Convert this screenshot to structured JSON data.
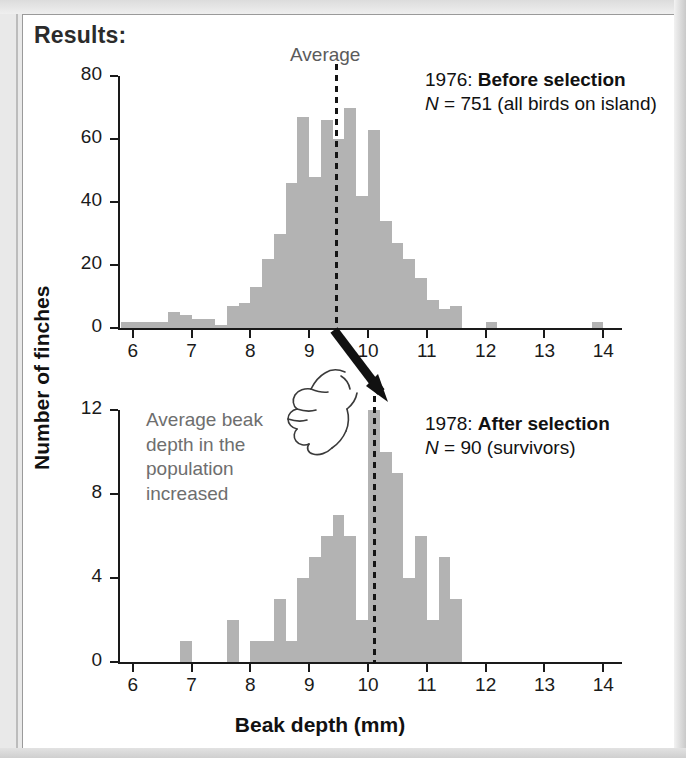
{
  "figure": {
    "heading": "Results:",
    "y_axis_title": "Number of finches",
    "x_axis_title": "Beak depth (mm)"
  },
  "panel1": {
    "average_label": "Average",
    "year_prefix": "1976:",
    "selection_label": "Before selection",
    "n_symbol": "N",
    "n_equals": "= 751 (all birds on island)"
  },
  "panel2": {
    "year_prefix": "1978:",
    "selection_label": "After selection",
    "n_symbol": "N",
    "n_equals": "= 90 (survivors)",
    "annotation": "Average beak depth in the population increased"
  },
  "icons": {
    "arrow": "down-right-arrow-icon",
    "hand": "pointing-hand-icon"
  },
  "colors": {
    "bar": "#b3b3b3",
    "axis": "#1a1a1a",
    "annotation_gray": "#6e6e6e",
    "average_label": "#5b5b5b"
  },
  "chart_data": [
    {
      "type": "bar",
      "title": "1976: Before selection",
      "subtitle": "N = 751 (all birds on island)",
      "xlabel": "Beak depth (mm)",
      "ylabel": "Number of finches",
      "xlim": [
        5.75,
        14.25
      ],
      "ylim": [
        0,
        80
      ],
      "xticks": [
        6,
        7,
        8,
        9,
        10,
        11,
        12,
        13,
        14
      ],
      "yticks": [
        0,
        20,
        40,
        60,
        80
      ],
      "bin_width": 0.2,
      "grid": false,
      "annotations": [
        {
          "text": "Average",
          "type": "vline",
          "x": 9.45,
          "style": "dashed"
        }
      ],
      "bins": [
        5.9,
        6.1,
        6.3,
        6.5,
        6.7,
        6.9,
        7.1,
        7.3,
        7.5,
        7.7,
        7.9,
        8.1,
        8.3,
        8.5,
        8.7,
        8.9,
        9.1,
        9.3,
        9.5,
        9.7,
        9.9,
        10.1,
        10.3,
        10.5,
        10.7,
        10.9,
        11.1,
        11.3,
        11.5,
        12.1,
        13.9
      ],
      "values": [
        2,
        2,
        2,
        2,
        5,
        4,
        3,
        3,
        1,
        7,
        8,
        13,
        22,
        30,
        46,
        67,
        48,
        66,
        60,
        70,
        42,
        63,
        34,
        27,
        22,
        16,
        9,
        6,
        7,
        2,
        2
      ]
    },
    {
      "type": "bar",
      "title": "1978: After selection",
      "subtitle": "N = 90 (survivors)",
      "xlabel": "Beak depth (mm)",
      "ylabel": "Number of finches",
      "xlim": [
        5.75,
        14.25
      ],
      "ylim": [
        0,
        12
      ],
      "xticks": [
        6,
        7,
        8,
        9,
        10,
        11,
        12,
        13,
        14
      ],
      "yticks": [
        0,
        4,
        8,
        12
      ],
      "bin_width": 0.2,
      "grid": false,
      "annotations": [
        {
          "text": "Average",
          "type": "vline",
          "x": 10.1,
          "style": "dashed"
        }
      ],
      "bins": [
        6.9,
        7.7,
        8.1,
        8.3,
        8.5,
        8.7,
        8.9,
        9.1,
        9.3,
        9.5,
        9.7,
        9.9,
        10.1,
        10.3,
        10.5,
        10.7,
        10.9,
        11.1,
        11.3,
        11.5
      ],
      "values": [
        1,
        2,
        1,
        1,
        3,
        1,
        4,
        5,
        6,
        7,
        6,
        2,
        12,
        10,
        9,
        4,
        6,
        2,
        5,
        3
      ]
    }
  ]
}
